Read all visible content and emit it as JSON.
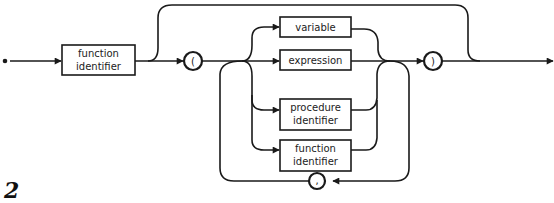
{
  "diagram": {
    "type": "syntax-diagram",
    "figure_label": "2",
    "start_box": {
      "line1": "function",
      "line2": "identifier"
    },
    "open_paren": "(",
    "close_paren": ")",
    "separator": ",",
    "alternatives": [
      {
        "line1": "variable",
        "line2": ""
      },
      {
        "line1": "expression",
        "line2": ""
      },
      {
        "line1": "procedure",
        "line2": "identifier"
      },
      {
        "line1": "function",
        "line2": "identifier"
      }
    ],
    "colors": {
      "stroke": "#1a1a1a",
      "background": "#ffffff"
    }
  }
}
